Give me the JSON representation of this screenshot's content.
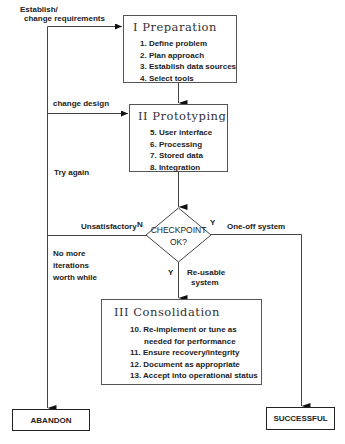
{
  "diagram": {
    "stages": [
      {
        "title": "I Preparation",
        "items": [
          "1. Define problem",
          "2. Plan approach",
          "3. Establish data sources",
          "4. Select tools"
        ]
      },
      {
        "title": "II Prototyping",
        "items": [
          "5. User interface",
          "6. Processing",
          "7. Stored data",
          "8. Integration"
        ]
      },
      {
        "title": "III Consolidation",
        "items": [
          "10. Re-implement or tune as",
          "needed for performance",
          "11. Ensure recovery/integrity",
          "12. Document as appropriate",
          "13. Accept into operational status"
        ]
      }
    ],
    "checkpoint": {
      "line1": "CHECKPOINT",
      "line2": "OK?"
    },
    "labels": {
      "establish_line1": "Establish/",
      "establish_line2": "change requirements",
      "change_design": "change design",
      "try_again": "Try again",
      "unsatisfactory": "Unsatisfactory",
      "n": "N",
      "y_right": "Y",
      "one_off": "One-off system",
      "no_more_1": "No more",
      "no_more_2": "iterations",
      "no_more_3": "worth  while",
      "y_down": "Y",
      "reusable_1": "Re-usable",
      "reusable_2": "system"
    },
    "outcomes": {
      "abandon": "ABANDON",
      "successful": "SUCCESSFUL"
    }
  }
}
